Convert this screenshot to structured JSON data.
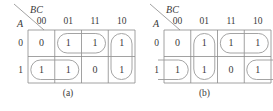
{
  "figure": {
    "maps": [
      {
        "id": "kmap-a",
        "caption": "(a)",
        "corner_top_label": "BC",
        "corner_side_label": "A",
        "column_headers": [
          "00",
          "01",
          "11",
          "10"
        ],
        "row_headers": [
          "0",
          "1"
        ],
        "cells": [
          [
            "0",
            "1",
            "1",
            "1"
          ],
          [
            "1",
            "1",
            "0",
            "1"
          ]
        ],
        "groups": [
          {
            "name": "group-row0-col01-col11",
            "shape": "rounded-rect",
            "row": 0,
            "col_start": 1,
            "col_span": 2
          },
          {
            "name": "group-col10-both-rows",
            "shape": "rounded-rect",
            "row": 0,
            "col_start": 3,
            "col_span": 1,
            "row_span": 2
          },
          {
            "name": "group-row1-col00-col01",
            "shape": "rounded-rect",
            "row": 1,
            "col_start": 0,
            "col_span": 2
          }
        ]
      },
      {
        "id": "kmap-b",
        "caption": "(b)",
        "corner_top_label": "BC",
        "corner_side_label": "A",
        "column_headers": [
          "00",
          "01",
          "11",
          "10"
        ],
        "row_headers": [
          "0",
          "1"
        ],
        "cells": [
          [
            "0",
            "1",
            "1",
            "1"
          ],
          [
            "1",
            "1",
            "0",
            "1"
          ]
        ],
        "groups": [
          {
            "name": "group-col01-both-rows",
            "shape": "rounded-rect",
            "row": 0,
            "col_start": 1,
            "col_span": 1,
            "row_span": 2
          },
          {
            "name": "group-row0-col11-col10",
            "shape": "rounded-rect",
            "row": 0,
            "col_start": 2,
            "col_span": 2
          },
          {
            "name": "group-row1-wrap-left",
            "shape": "half-rounded-left",
            "row": 1,
            "col_start": 0
          },
          {
            "name": "group-row1-wrap-right",
            "shape": "half-rounded-right",
            "row": 1,
            "col_start": 3
          }
        ]
      }
    ],
    "colors": {
      "grid_line": "#8a8a8a",
      "group_outline": "#9a9a9a",
      "text": "#3a3a3a"
    }
  }
}
